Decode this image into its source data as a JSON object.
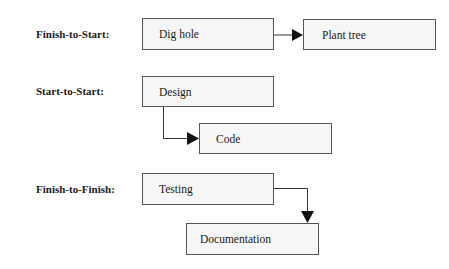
{
  "diagram": {
    "rows": [
      {
        "label": "Finish-to-Start:",
        "from": "Dig hole",
        "to": "Plant tree"
      },
      {
        "label": "Start-to-Start:",
        "from": "Design",
        "to": "Code"
      },
      {
        "label": "Finish-to-Finish:",
        "from": "Testing",
        "to": "Documentation"
      }
    ],
    "colors": {
      "box_fill": "#f6f6f6",
      "box_border": "#555555",
      "arrow": "#1a1a1a"
    }
  }
}
